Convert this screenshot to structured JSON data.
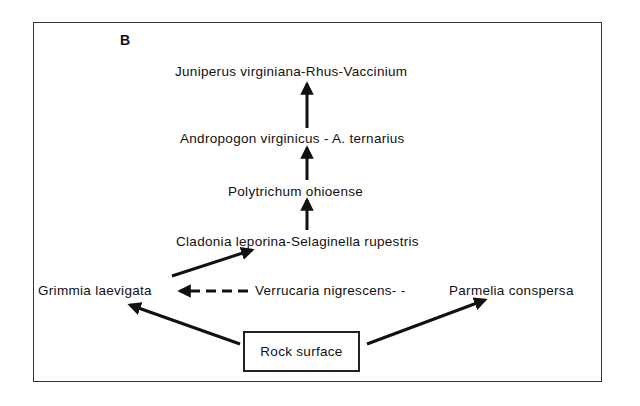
{
  "figure": {
    "panel_label": "B",
    "nodes": {
      "juniperus": "Juniperus virginiana-Rhus-Vaccinium",
      "andropogon": "Andropogon virginicus - A. ternarius",
      "polytrichum": "Polytrichum ohioense",
      "cladonia": "Cladonia leporina-Selaginella rupestris",
      "grimmia": "Grimmia laevigata",
      "verrucaria": "Verrucaria nigrescens- -",
      "parmelia": "Parmelia conspersa",
      "rock": "Rock surface"
    },
    "edges": [
      {
        "from": "rock",
        "to": "grimmia",
        "style": "solid"
      },
      {
        "from": "rock",
        "to": "parmelia",
        "style": "solid"
      },
      {
        "from": "verrucaria",
        "to": "grimmia",
        "style": "dashed"
      },
      {
        "from": "grimmia",
        "to": "cladonia",
        "style": "solid"
      },
      {
        "from": "cladonia",
        "to": "polytrichum",
        "style": "solid"
      },
      {
        "from": "polytrichum",
        "to": "andropogon",
        "style": "solid"
      },
      {
        "from": "andropogon",
        "to": "juniperus",
        "style": "solid"
      }
    ]
  }
}
